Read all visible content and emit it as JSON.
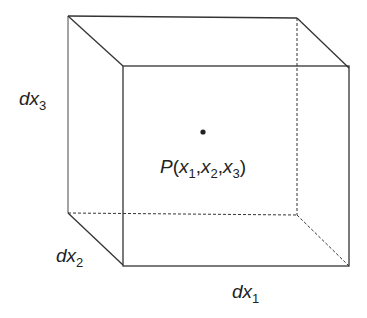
{
  "diagram": {
    "point_label": {
      "base": "P",
      "open": "(",
      "x1": "x",
      "s1": "1",
      "c1": ",",
      "x2": "x",
      "s2": "2",
      "c2": ",",
      "x3": "x",
      "s3": "3",
      "close": ")"
    },
    "edge_labels": {
      "dx1": {
        "d": "dx",
        "sub": "1"
      },
      "dx2": {
        "d": "dx",
        "sub": "2"
      },
      "dx3": {
        "d": "dx",
        "sub": "3"
      }
    },
    "colors": {
      "line": "#333333",
      "text": "#222222",
      "background": "#ffffff"
    }
  }
}
